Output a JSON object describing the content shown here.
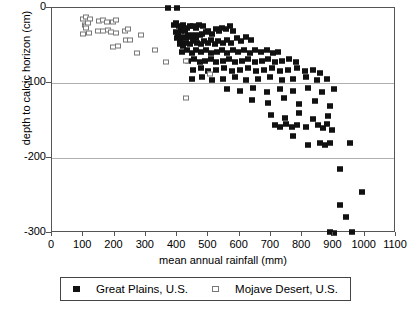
{
  "chart_data": {
    "type": "scatter",
    "title": "",
    "xlabel": "mean annual rainfall (mm)",
    "ylabel": "depth to calcic horizon (cm)",
    "xlim": [
      0,
      1100
    ],
    "ylim": [
      -300,
      0
    ],
    "xticks": [
      0,
      100,
      200,
      300,
      400,
      500,
      600,
      700,
      800,
      900,
      1000,
      1100
    ],
    "yticks": [
      0,
      -100,
      -200,
      -300
    ],
    "grid": "horizontal gridlines at -100 and -200",
    "legend_position": "below plot, centered",
    "series": [
      {
        "name": "Great Plains, U.S.",
        "marker": "filled-square",
        "color": "#111111",
        "points": [
          [
            370,
            0
          ],
          [
            400,
            0
          ],
          [
            390,
            -22
          ],
          [
            398,
            -20
          ],
          [
            405,
            -24
          ],
          [
            412,
            -26
          ],
          [
            418,
            -22
          ],
          [
            395,
            -32
          ],
          [
            404,
            -34
          ],
          [
            412,
            -30
          ],
          [
            425,
            -30
          ],
          [
            432,
            -27
          ],
          [
            440,
            -24
          ],
          [
            452,
            -24
          ],
          [
            462,
            -26
          ],
          [
            470,
            -22
          ],
          [
            482,
            -24
          ],
          [
            400,
            -40
          ],
          [
            410,
            -42
          ],
          [
            420,
            -38
          ],
          [
            428,
            -40
          ],
          [
            436,
            -36
          ],
          [
            445,
            -38
          ],
          [
            455,
            -36
          ],
          [
            462,
            -40
          ],
          [
            472,
            -36
          ],
          [
            480,
            -34
          ],
          [
            492,
            -32
          ],
          [
            500,
            -30
          ],
          [
            512,
            -34
          ],
          [
            524,
            -28
          ],
          [
            534,
            -30
          ],
          [
            545,
            -26
          ],
          [
            556,
            -28
          ],
          [
            568,
            -24
          ],
          [
            580,
            -30
          ],
          [
            408,
            -48
          ],
          [
            418,
            -50
          ],
          [
            430,
            -46
          ],
          [
            442,
            -48
          ],
          [
            452,
            -44
          ],
          [
            464,
            -46
          ],
          [
            476,
            -48
          ],
          [
            486,
            -44
          ],
          [
            498,
            -46
          ],
          [
            508,
            -42
          ],
          [
            520,
            -48
          ],
          [
            532,
            -44
          ],
          [
            546,
            -46
          ],
          [
            558,
            -42
          ],
          [
            572,
            -46
          ],
          [
            590,
            -40
          ],
          [
            604,
            -44
          ],
          [
            620,
            -38
          ],
          [
            636,
            -42
          ],
          [
            415,
            -58
          ],
          [
            432,
            -56
          ],
          [
            448,
            -60
          ],
          [
            462,
            -56
          ],
          [
            478,
            -58
          ],
          [
            494,
            -56
          ],
          [
            510,
            -60
          ],
          [
            528,
            -58
          ],
          [
            544,
            -56
          ],
          [
            560,
            -60
          ],
          [
            578,
            -56
          ],
          [
            596,
            -58
          ],
          [
            614,
            -56
          ],
          [
            632,
            -60
          ],
          [
            650,
            -56
          ],
          [
            668,
            -58
          ],
          [
            688,
            -56
          ],
          [
            706,
            -60
          ],
          [
            724,
            -58
          ],
          [
            436,
            -70
          ],
          [
            455,
            -68
          ],
          [
            472,
            -72
          ],
          [
            490,
            -70
          ],
          [
            508,
            -68
          ],
          [
            526,
            -72
          ],
          [
            546,
            -70
          ],
          [
            566,
            -68
          ],
          [
            586,
            -72
          ],
          [
            606,
            -70
          ],
          [
            628,
            -68
          ],
          [
            648,
            -72
          ],
          [
            670,
            -70
          ],
          [
            692,
            -68
          ],
          [
            714,
            -72
          ],
          [
            736,
            -70
          ],
          [
            758,
            -68
          ],
          [
            780,
            -72
          ],
          [
            452,
            -82
          ],
          [
            476,
            -80
          ],
          [
            500,
            -84
          ],
          [
            524,
            -82
          ],
          [
            550,
            -80
          ],
          [
            574,
            -84
          ],
          [
            600,
            -82
          ],
          [
            626,
            -80
          ],
          [
            652,
            -84
          ],
          [
            678,
            -82
          ],
          [
            704,
            -80
          ],
          [
            730,
            -84
          ],
          [
            756,
            -82
          ],
          [
            782,
            -80
          ],
          [
            808,
            -84
          ],
          [
            834,
            -82
          ],
          [
            856,
            -86
          ],
          [
            448,
            -95
          ],
          [
            480,
            -92
          ],
          [
            512,
            -96
          ],
          [
            548,
            -94
          ],
          [
            584,
            -92
          ],
          [
            620,
            -96
          ],
          [
            658,
            -94
          ],
          [
            696,
            -92
          ],
          [
            734,
            -96
          ],
          [
            772,
            -94
          ],
          [
            812,
            -92
          ],
          [
            848,
            -96
          ],
          [
            880,
            -94
          ],
          [
            560,
            -108
          ],
          [
            600,
            -110
          ],
          [
            642,
            -106
          ],
          [
            688,
            -112
          ],
          [
            730,
            -108
          ],
          [
            772,
            -110
          ],
          [
            818,
            -106
          ],
          [
            862,
            -112
          ],
          [
            902,
            -108
          ],
          [
            640,
            -122
          ],
          [
            690,
            -126
          ],
          [
            742,
            -120
          ],
          [
            790,
            -128
          ],
          [
            840,
            -124
          ],
          [
            888,
            -130
          ],
          [
            700,
            -142
          ],
          [
            744,
            -146
          ],
          [
            790,
            -140
          ],
          [
            836,
            -148
          ],
          [
            884,
            -144
          ],
          [
            712,
            -156
          ],
          [
            730,
            -158
          ],
          [
            748,
            -155
          ],
          [
            766,
            -158
          ],
          [
            784,
            -156
          ],
          [
            812,
            -158
          ],
          [
            850,
            -156
          ],
          [
            866,
            -160
          ],
          [
            880,
            -155
          ],
          [
            896,
            -162
          ],
          [
            770,
            -170
          ],
          [
            820,
            -182
          ],
          [
            856,
            -180
          ],
          [
            872,
            -182
          ],
          [
            888,
            -180
          ],
          [
            952,
            -180
          ],
          [
            920,
            -215
          ],
          [
            990,
            -245
          ],
          [
            920,
            -262
          ],
          [
            940,
            -278
          ],
          [
            890,
            -298
          ],
          [
            902,
            -300
          ],
          [
            960,
            -298
          ]
        ]
      },
      {
        "name": "Mojave Desert, U.S.",
        "marker": "open-square",
        "color": "#777777",
        "points": [
          [
            100,
            -15
          ],
          [
            110,
            -12
          ],
          [
            122,
            -14
          ],
          [
            104,
            -22
          ],
          [
            110,
            -24
          ],
          [
            116,
            -20
          ],
          [
            108,
            -26
          ],
          [
            100,
            -34
          ],
          [
            118,
            -33
          ],
          [
            150,
            -17
          ],
          [
            162,
            -16
          ],
          [
            176,
            -18
          ],
          [
            148,
            -30
          ],
          [
            162,
            -31
          ],
          [
            178,
            -29
          ],
          [
            196,
            -18
          ],
          [
            206,
            -16
          ],
          [
            190,
            -32
          ],
          [
            204,
            -33
          ],
          [
            232,
            -30
          ],
          [
            242,
            -28
          ],
          [
            238,
            -42
          ],
          [
            250,
            -43
          ],
          [
            196,
            -52
          ],
          [
            210,
            -50
          ],
          [
            284,
            -36
          ],
          [
            272,
            -60
          ],
          [
            330,
            -56
          ],
          [
            366,
            -72
          ],
          [
            430,
            -70
          ],
          [
            506,
            -88
          ],
          [
            430,
            -120
          ]
        ]
      }
    ]
  },
  "axes": {
    "x_tick_labels": [
      "0",
      "100",
      "200",
      "300",
      "400",
      "500",
      "600",
      "700",
      "800",
      "900",
      "1000",
      "1100"
    ],
    "y_tick_labels": [
      "0",
      "-100",
      "-200",
      "-300"
    ],
    "x_title": "mean annual rainfall (mm)",
    "y_title": "depth to calcic horizon (cm)"
  },
  "legend": {
    "entries": [
      {
        "label": "Great Plains, U.S.",
        "marker": "filled-square"
      },
      {
        "label": "Mojave Desert, U.S.",
        "marker": "open-square"
      }
    ]
  }
}
